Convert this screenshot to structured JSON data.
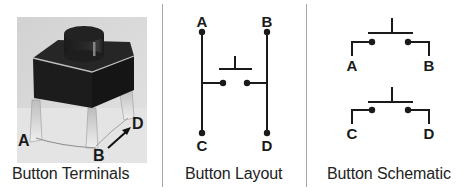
{
  "figure": {
    "panels": [
      {
        "id": "terminals",
        "caption": "Button Terminals",
        "labels": {
          "a": "A",
          "b": "B",
          "d": "D"
        }
      },
      {
        "id": "layout",
        "caption": "Button Layout",
        "labels": {
          "a": "A",
          "b": "B",
          "c": "C",
          "d": "D"
        }
      },
      {
        "id": "schematic",
        "caption": "Button Schematic",
        "labels": {
          "a": "A",
          "b": "B",
          "c": "C",
          "d": "D"
        }
      }
    ],
    "colors": {
      "ink": "#1a1a1a",
      "photo_bg": "#d9d9d9",
      "switch_body": "#1c1c1c",
      "divider": "#a8a8a8"
    }
  }
}
